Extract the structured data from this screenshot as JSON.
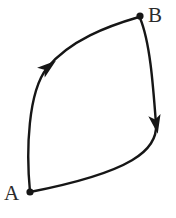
{
  "figure": {
    "background_color": "#ffffff",
    "stroke_color": "#161616",
    "label_color": "#2b2b2b",
    "width": 176,
    "height": 218
  },
  "nodes": [
    {
      "id": "A",
      "label": "A",
      "dot_x": 30,
      "dot_y": 192,
      "dot_radius": 3.6,
      "label_x": 4,
      "label_y": 200
    },
    {
      "id": "B",
      "label": "B",
      "dot_x": 140,
      "dot_y": 16,
      "dot_radius": 3.6,
      "label_x": 148,
      "label_y": 22
    }
  ],
  "paths": [
    {
      "id": "upper",
      "from": "A",
      "to": "B",
      "direction": "A to B",
      "d": "M30,192 C26,150 28,92 47,68 C70,40 108,26 139,17",
      "arrow": {
        "x": 48,
        "y": 67,
        "angle_deg": -38,
        "name": "arrowhead-upper"
      }
    },
    {
      "id": "lower",
      "from": "B",
      "to": "A",
      "direction": "B to A",
      "d": "M140,18 C150,42 153,84 156,124 C158,150 132,172 30,192",
      "arrow": {
        "x": 156,
        "y": 124,
        "angle_deg": 80,
        "name": "arrowhead-lower"
      }
    }
  ]
}
